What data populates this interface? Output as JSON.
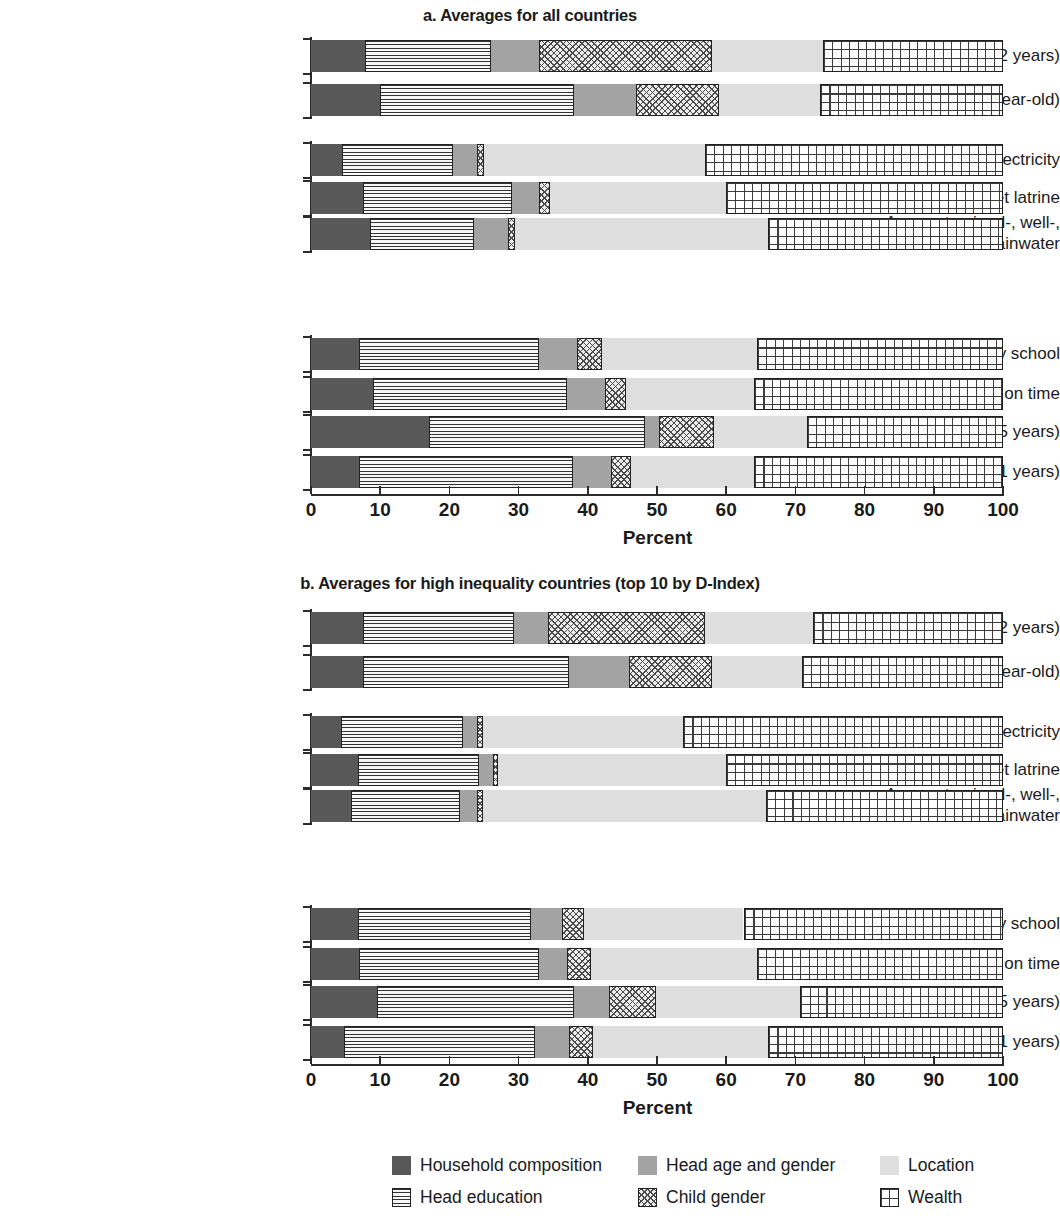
{
  "axis": {
    "xlabel": "Percent",
    "ticks": [
      0,
      10,
      20,
      30,
      40,
      50,
      60,
      70,
      80,
      90,
      100
    ],
    "xmin": 0,
    "xmax": 100
  },
  "legend": {
    "items": [
      {
        "key": "household",
        "label": "Household composition",
        "color": "#585858",
        "pattern": "solid-dark"
      },
      {
        "key": "headedu",
        "label": "Head education",
        "color": "#f2f2f2",
        "pattern": "horizontal-lines"
      },
      {
        "key": "headage",
        "label": "Head age and gender",
        "color": "#a3a3a3",
        "pattern": "solid-mid"
      },
      {
        "key": "childgender",
        "label": "Child gender",
        "color": "#ededed",
        "pattern": "crosshatch"
      },
      {
        "key": "location",
        "label": "Location",
        "color": "#dedede",
        "pattern": "solid-light"
      },
      {
        "key": "wealth",
        "label": "Wealth",
        "color": "#ffffff",
        "pattern": "grid"
      }
    ]
  },
  "chart_data": [
    {
      "type": "bar",
      "orientation": "horizontal",
      "stacked": true,
      "title": "a. Averages for all countries",
      "xlabel": "Percent",
      "ylabel": "",
      "xlim": [
        0,
        100
      ],
      "grid": false,
      "legend_position": "bottom",
      "categories": [
        "No stunting (0–2 years)",
        "Full immunization (1-year-old)",
        "Access to electricity",
        "Access to flush or pit toilet latrine",
        "Access to piped-, well-,\nor rainwater",
        "Finished primary school",
        "Started primary on time",
        "School attendance (12–15 years)",
        "School attendance (6–11 years)"
      ],
      "series": [
        {
          "name": "Household composition",
          "values": [
            7.8,
            10.0,
            4.5,
            7.5,
            8.5,
            7.0,
            9.0,
            17.0,
            7.0
          ]
        },
        {
          "name": "Head education",
          "values": [
            18.2,
            28.0,
            16.0,
            21.5,
            15.0,
            26.0,
            28.0,
            31.3,
            30.8
          ]
        },
        {
          "name": "Head age and gender",
          "values": [
            7.0,
            9.0,
            3.5,
            4.0,
            5.0,
            5.5,
            5.5,
            2.0,
            5.5
          ]
        },
        {
          "name": "Child gender",
          "values": [
            25.0,
            12.0,
            1.0,
            1.5,
            1.0,
            3.5,
            3.0,
            8.0,
            3.0
          ]
        },
        {
          "name": "Location",
          "values": [
            16.0,
            14.5,
            32.0,
            25.5,
            36.5,
            22.5,
            18.5,
            13.4,
            17.7
          ]
        },
        {
          "name": "Wealth",
          "values": [
            26.0,
            26.5,
            43.0,
            40.0,
            34.0,
            35.5,
            36.0,
            28.3,
            36.0
          ]
        }
      ]
    },
    {
      "type": "bar",
      "orientation": "horizontal",
      "stacked": true,
      "title": "b. Averages for high inequality countries (top 10 by D-Index)",
      "xlabel": "Percent",
      "ylabel": "",
      "xlim": [
        0,
        100
      ],
      "grid": false,
      "legend_position": "bottom",
      "categories": [
        "No stunting (0–2 years)",
        "Full immunization (1-year-old)",
        "Access to electricity",
        "Access to flush or pit toilet latrine",
        "Access to piped-, well-,\nor rainwater",
        "Finished primary school",
        "Started primary on time",
        "School attendance (12–15 years)",
        "School attendance (6–11 years)"
      ],
      "series": [
        {
          "name": "Household composition",
          "values": [
            7.5,
            7.5,
            4.3,
            6.8,
            5.8,
            6.8,
            7.0,
            9.5,
            4.8
          ]
        },
        {
          "name": "Head education",
          "values": [
            21.8,
            29.8,
            17.7,
            17.5,
            15.7,
            25.0,
            26.0,
            28.5,
            27.5
          ]
        },
        {
          "name": "Head age and gender",
          "values": [
            5.0,
            8.7,
            2.0,
            2.0,
            2.5,
            4.5,
            4.0,
            5.0,
            5.0
          ]
        },
        {
          "name": "Child gender",
          "values": [
            22.7,
            12.0,
            0.8,
            0.7,
            0.8,
            3.2,
            3.5,
            6.8,
            3.5
          ]
        },
        {
          "name": "Location",
          "values": [
            15.5,
            13.0,
            28.9,
            33.0,
            41.0,
            23.0,
            24.0,
            20.9,
            25.2
          ]
        },
        {
          "name": "Wealth",
          "values": [
            27.5,
            29.0,
            46.3,
            40.0,
            34.2,
            37.5,
            35.5,
            29.3,
            34.0
          ]
        }
      ]
    }
  ]
}
